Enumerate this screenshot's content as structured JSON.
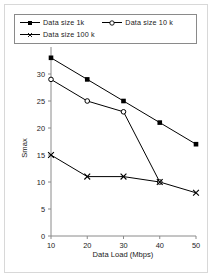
{
  "figure": {
    "frame_color": "#d8d8d8",
    "background": "#ffffff",
    "line_color": "#000000"
  },
  "legend": {
    "position": "top-inside",
    "border_color": "#8a8a8a",
    "entries": [
      {
        "label": "Data size 1k",
        "marker": "filled-square-marker",
        "marker_type": "square"
      },
      {
        "label": "Data size 10 k",
        "marker": "open-circle-marker",
        "marker_type": "circle"
      },
      {
        "label": "Data size 100 k",
        "marker": "cross-marker",
        "marker_type": "cross"
      }
    ]
  },
  "axes": {
    "x": {
      "title": "Data Load (Mbps)",
      "ticks": [
        "10",
        "20",
        "30",
        "40",
        "50"
      ],
      "min": 10,
      "max": 50
    },
    "y": {
      "title": "Smax",
      "ticks": [
        "0",
        "5",
        "10",
        "15",
        "20",
        "25",
        "30"
      ],
      "min": 0,
      "max": 35
    }
  },
  "chart_data": {
    "type": "line",
    "title": "",
    "xlabel": "Data Load (Mbps)",
    "ylabel": "Smax",
    "x": [
      10,
      20,
      30,
      40,
      50
    ],
    "xlim": [
      10,
      50
    ],
    "ylim": [
      0,
      35
    ],
    "grid": false,
    "legend_position": "top",
    "series": [
      {
        "name": "Data size 1k",
        "marker": "square",
        "values": [
          33,
          29,
          25,
          21,
          17
        ]
      },
      {
        "name": "Data size 10 k",
        "marker": "circle",
        "values": [
          29,
          25,
          23,
          10,
          null
        ]
      },
      {
        "name": "Data size 100 k",
        "marker": "cross",
        "values": [
          15,
          11,
          11,
          10,
          8
        ]
      }
    ]
  }
}
